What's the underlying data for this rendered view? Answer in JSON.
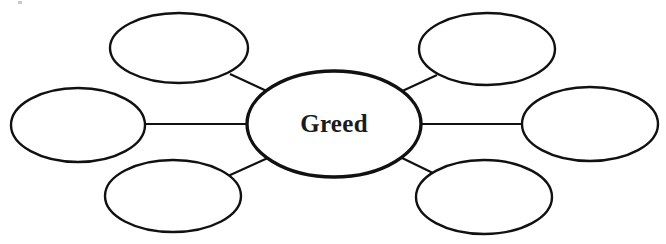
{
  "diagram": {
    "type": "word-web",
    "background_color": "#ffffff",
    "stroke_color": "#111111",
    "text_color": "#1b1b1b",
    "center": {
      "id": "center-node",
      "label": "Greed",
      "cx": 334,
      "cy": 124,
      "rx": 87,
      "ry": 53
    },
    "satellites": [
      {
        "id": "node-top-left",
        "label": "",
        "cx": 179,
        "cy": 48,
        "rx": 69,
        "ry": 35
      },
      {
        "id": "node-top-right",
        "label": "",
        "cx": 487,
        "cy": 49,
        "rx": 68,
        "ry": 36
      },
      {
        "id": "node-left",
        "label": "",
        "cx": 78,
        "cy": 125,
        "rx": 67,
        "ry": 37
      },
      {
        "id": "node-right",
        "label": "",
        "cx": 590,
        "cy": 124,
        "rx": 68,
        "ry": 37
      },
      {
        "id": "node-bottom-left",
        "label": "",
        "cx": 173,
        "cy": 196,
        "rx": 68,
        "ry": 36
      },
      {
        "id": "node-bottom-right",
        "label": "",
        "cx": 484,
        "cy": 197,
        "rx": 68,
        "ry": 37
      }
    ],
    "connectors": [
      {
        "id": "connector-top-left",
        "from": "node-top-left",
        "to": "center-node",
        "x1": 230,
        "y1": 74,
        "x2": 271,
        "y2": 93
      },
      {
        "id": "connector-left",
        "from": "node-left",
        "to": "center-node",
        "x1": 145,
        "y1": 124,
        "x2": 247,
        "y2": 124
      },
      {
        "id": "connector-bottom-left",
        "from": "node-bottom-left",
        "to": "center-node",
        "x1": 228,
        "y1": 176,
        "x2": 270,
        "y2": 157
      },
      {
        "id": "connector-top-right",
        "from": "center-node",
        "to": "node-top-right",
        "x1": 398,
        "y1": 93,
        "x2": 437,
        "y2": 75
      },
      {
        "id": "connector-right",
        "from": "center-node",
        "to": "node-right",
        "x1": 422,
        "y1": 124,
        "x2": 522,
        "y2": 124
      },
      {
        "id": "connector-bottom-right",
        "from": "center-node",
        "to": "node-bottom-right",
        "x1": 398,
        "y1": 156,
        "x2": 437,
        "y2": 175
      }
    ]
  }
}
